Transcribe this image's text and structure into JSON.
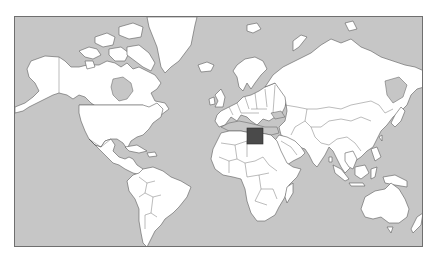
{
  "map": {
    "type": "world political outline map",
    "projection": "Mercator",
    "highlighted_country": "Egypt",
    "colors": {
      "ocean": "#c6c6c6",
      "land": "#ffffff",
      "border": "#5a5a5a",
      "frame": "#6f6f6f",
      "highlight": "#4a4a4a"
    }
  }
}
